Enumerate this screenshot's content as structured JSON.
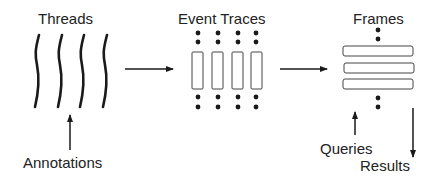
{
  "diagram": {
    "stages": [
      {
        "id": "threads",
        "label": "Threads",
        "count": 4,
        "shape": "wavy-line"
      },
      {
        "id": "event-traces",
        "label": "Event Traces",
        "count": 4,
        "shape": "vertical-rectangle"
      },
      {
        "id": "frames",
        "label": "Frames",
        "count": 3,
        "shape": "horizontal-rectangle"
      }
    ],
    "annotations": {
      "threads_input": "Annotations",
      "frames_input": "Queries",
      "frames_output": "Results"
    },
    "edges": [
      {
        "from": "threads",
        "to": "event-traces"
      },
      {
        "from": "event-traces",
        "to": "frames"
      },
      {
        "from": "Annotations",
        "to": "threads"
      },
      {
        "from": "Queries",
        "to": "frames"
      },
      {
        "from": "frames",
        "to": "Results"
      }
    ],
    "colors": {
      "ink": "#1a1a1a",
      "background": "#ffffff"
    }
  }
}
